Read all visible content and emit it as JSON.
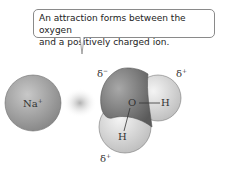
{
  "callout": {
    "line1": "An attraction forms between the oxygen",
    "line2": "and a positively charged ion."
  },
  "ion": {
    "symbol": "Na",
    "charge": "+"
  },
  "water": {
    "oxygen": "O",
    "hydrogen1": "H",
    "hydrogen2": "H",
    "oxygen_partial": "δ",
    "oxygen_partial_sign": "−",
    "h1_partial": "δ",
    "h1_partial_sign": "+",
    "h2_partial": "δ",
    "h2_partial_sign": "+"
  },
  "colors": {
    "ion_fill": "#9a9a9a",
    "oxygen_fill": "#777777",
    "hydrogen_fill": "#d8d8d8",
    "attraction_glow": "#b0b0b0"
  }
}
